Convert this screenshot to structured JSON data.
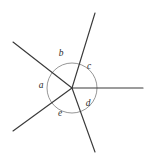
{
  "figure": {
    "background_color": "#ffffff",
    "line_color": "#3a3a3a",
    "circle_color": "#8a8a8a",
    "label_color": "#2b2b2b",
    "vertex": {
      "x": 72,
      "y": 88
    },
    "circle": {
      "cx": 72,
      "cy": 88,
      "r": 25
    },
    "rays": [
      {
        "name": "ray-upper-left",
        "x1": 72,
        "y1": 88,
        "x2": 13,
        "y2": 42
      },
      {
        "name": "ray-upper-right",
        "x1": 72,
        "y1": 88,
        "x2": 95,
        "y2": 13
      },
      {
        "name": "ray-right",
        "x1": 72,
        "y1": 88,
        "x2": 143,
        "y2": 88
      },
      {
        "name": "ray-lower-right",
        "x1": 72,
        "y1": 88,
        "x2": 95,
        "y2": 152
      },
      {
        "name": "ray-lower-left",
        "x1": 72,
        "y1": 88,
        "x2": 13,
        "y2": 131
      }
    ],
    "labels": [
      {
        "id": "a",
        "text": "a",
        "x": 41,
        "y": 86
      },
      {
        "id": "b",
        "text": "b",
        "x": 61,
        "y": 54
      },
      {
        "id": "c",
        "text": "c",
        "x": 89,
        "y": 67
      },
      {
        "id": "d",
        "text": "d",
        "x": 88,
        "y": 104
      },
      {
        "id": "e",
        "text": "e",
        "x": 60,
        "y": 114
      }
    ]
  },
  "chart_data": {
    "type": "diagram",
    "subtype": "angles-at-a-point",
    "vertex_label": "",
    "ray_count": 5,
    "angle_labels": [
      "a",
      "b",
      "c",
      "d",
      "e"
    ],
    "angle_order_counterclockwise": [
      "c",
      "b",
      "a",
      "e",
      "d"
    ],
    "sum_of_angles_degrees": 360,
    "ray_directions_degrees": [
      {
        "ray": "ray-upper-right",
        "angle": 72.9
      },
      {
        "ray": "ray-upper-left",
        "angle": 142.1
      },
      {
        "ray": "ray-lower-left",
        "angle": 216.1
      },
      {
        "ray": "ray-lower-right",
        "angle": 289.7
      },
      {
        "ray": "ray-right",
        "angle": 0.0
      }
    ],
    "angle_sectors": [
      {
        "label": "a",
        "between": [
          "ray-upper-left",
          "ray-lower-left"
        ],
        "measure_degrees": 74
      },
      {
        "label": "b",
        "between": [
          "ray-upper-right",
          "ray-upper-left"
        ],
        "measure_degrees": 69
      },
      {
        "label": "c",
        "between": [
          "ray-right",
          "ray-upper-right"
        ],
        "measure_degrees": 73
      },
      {
        "label": "d",
        "between": [
          "ray-lower-right",
          "ray-right"
        ],
        "measure_degrees": 70
      },
      {
        "label": "e",
        "between": [
          "ray-lower-left",
          "ray-lower-right"
        ],
        "measure_degrees": 74
      }
    ],
    "grid": false,
    "legend": false,
    "xlabel": "",
    "ylabel": ""
  }
}
